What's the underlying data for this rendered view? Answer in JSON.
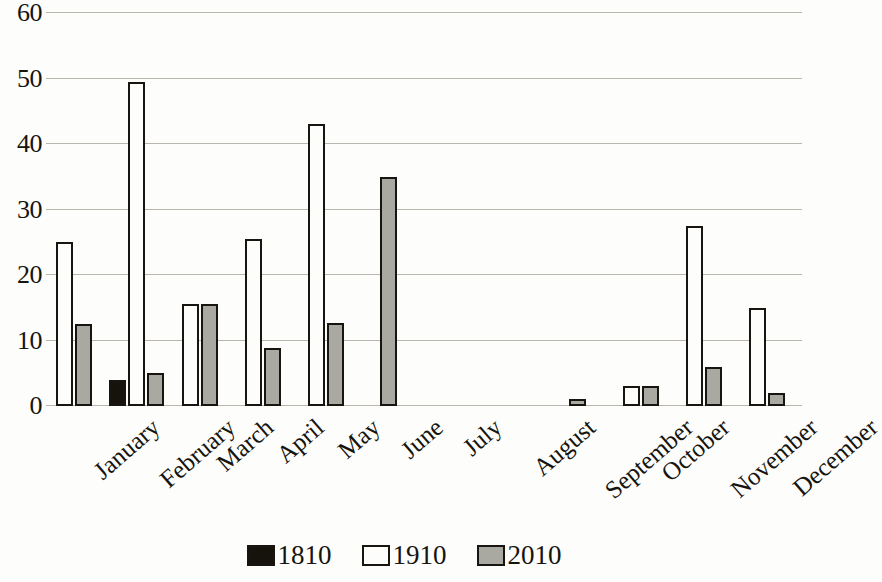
{
  "chart_data": {
    "type": "bar",
    "title": "",
    "subtitle": "",
    "xlabel": "",
    "ylabel": "",
    "ylim": [
      0,
      60
    ],
    "ytick_step": 10,
    "yticks": [
      60,
      50,
      40,
      30,
      20,
      10,
      0
    ],
    "grid": true,
    "legend_position": "bottom",
    "categories": [
      "January",
      "February",
      "March",
      "April",
      "May",
      "June",
      "July",
      "August",
      "September",
      "October",
      "November",
      "December"
    ],
    "series": [
      {
        "name": "1810",
        "color": "#16120c",
        "values": [
          0,
          4,
          0,
          0,
          0,
          0,
          0,
          0,
          0,
          0,
          0,
          0
        ]
      },
      {
        "name": "1910",
        "color": "#fdfdfb",
        "values": [
          25,
          49.5,
          15.5,
          25.5,
          43,
          0,
          0,
          0,
          0,
          3,
          27.5,
          15
        ]
      },
      {
        "name": "2010",
        "color": "#a9a8a1",
        "values": [
          12.5,
          5,
          15.5,
          8.8,
          12.7,
          35,
          0,
          0,
          1,
          3,
          6,
          2
        ]
      }
    ]
  },
  "legend": {
    "items": [
      {
        "label": "1810",
        "swatch": "s1810"
      },
      {
        "label": "1910",
        "swatch": "s1910"
      },
      {
        "label": "2010",
        "swatch": "s2010"
      }
    ]
  },
  "colors": {
    "ink": "#16140f",
    "gridline": "#b9b7ad",
    "background": "#fdfdfb",
    "series_1810": "#16120c",
    "series_1910": "#fdfdfb",
    "series_2010": "#a9a8a1"
  }
}
